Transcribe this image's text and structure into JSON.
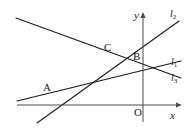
{
  "figure": {
    "kind": "coordinate-geometry-diagram",
    "background_color": "#ffffff",
    "stroke_color": "#1a1a1a",
    "text_color": "#1a1a1a",
    "width": 192,
    "height": 129
  },
  "axes": {
    "x_axis": {
      "label": "x",
      "label_x": 170,
      "label_y": 110,
      "start_x": 17,
      "start_y": 105,
      "end_x": 182,
      "end_y": 105,
      "arrow": "right"
    },
    "y_axis": {
      "label": "y",
      "label_x": 134,
      "label_y": 10,
      "start_x": 143,
      "start_y": 122,
      "end_x": 143,
      "end_y": 12,
      "arrow": "up"
    },
    "origin": {
      "label": "O",
      "label_x": 134,
      "label_y": 107,
      "x": 143,
      "y": 105
    }
  },
  "lines": [
    {
      "name": "l1",
      "label": "l",
      "subscript": "1",
      "description": "shallow ascending line through A and B",
      "x1": 17,
      "y1": 101,
      "x2": 181,
      "y2": 61,
      "label_x": 171,
      "label_y": 57
    },
    {
      "name": "l2",
      "label": "l",
      "subscript": "2",
      "description": "steep ascending line through A and C",
      "x1": 37,
      "y1": 123,
      "x2": 179,
      "y2": 21,
      "label_x": 170,
      "label_y": 9
    },
    {
      "name": "l3",
      "label": "l",
      "subscript": "3",
      "description": "descending line from upper left through C and B",
      "x1": 16,
      "y1": 18,
      "x2": 181,
      "y2": 78,
      "label_x": 171,
      "label_y": 73
    }
  ],
  "points": [
    {
      "name": "A",
      "label": "A",
      "description": "intersection of l1 and l2, below the x-axis region at left",
      "x": 52,
      "y": 97,
      "label_x": 43,
      "label_y": 82
    },
    {
      "name": "B",
      "label": "B",
      "description": "intersection of l1 and l3, on the y-axis",
      "x": 143,
      "y": 67,
      "label_x": 133,
      "label_y": 51
    },
    {
      "name": "C",
      "label": "C",
      "description": "intersection of l2 and l3",
      "x": 112,
      "y": 57,
      "label_x": 104,
      "label_y": 42
    }
  ]
}
